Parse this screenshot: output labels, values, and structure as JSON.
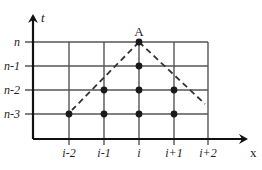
{
  "diagram": {
    "title": "",
    "axes": {
      "x_label": "x",
      "y_label": "t",
      "origin": [
        33,
        139
      ],
      "x_axis_end": 250,
      "y_axis_top": 12
    },
    "colors": {
      "grid": "#555555",
      "axis": "#111111",
      "point": "#1a1a1a",
      "dashed": "#333333",
      "text": "#222222"
    },
    "rows": [
      {
        "label": "n",
        "y": 42
      },
      {
        "label": "n-1",
        "y": 66
      },
      {
        "label": "n-2",
        "y": 90
      },
      {
        "label": "n-3",
        "y": 114
      }
    ],
    "columns": [
      {
        "label": "i-2",
        "x": 69
      },
      {
        "label": "i-1",
        "x": 104
      },
      {
        "label": "i",
        "x": 139
      },
      {
        "label": "i+1",
        "x": 174
      },
      {
        "label": "i+2",
        "x": 208
      }
    ],
    "apex": {
      "label": "A",
      "col": "i",
      "row": "n",
      "x": 139,
      "y": 42
    },
    "points": [
      {
        "col": "i",
        "row": "n"
      },
      {
        "col": "i",
        "row": "n-1"
      },
      {
        "col": "i-1",
        "row": "n-2"
      },
      {
        "col": "i",
        "row": "n-2"
      },
      {
        "col": "i+1",
        "row": "n-2"
      },
      {
        "col": "i-2",
        "row": "n-3"
      },
      {
        "col": "i-1",
        "row": "n-3"
      },
      {
        "col": "i",
        "row": "n-3"
      },
      {
        "col": "i+1",
        "row": "n-3"
      }
    ],
    "dashed_lines": [
      {
        "from": [
          139,
          42
        ],
        "to": [
          72,
          110
        ]
      },
      {
        "from": [
          139,
          42
        ],
        "to": [
          205,
          104
        ]
      }
    ]
  }
}
